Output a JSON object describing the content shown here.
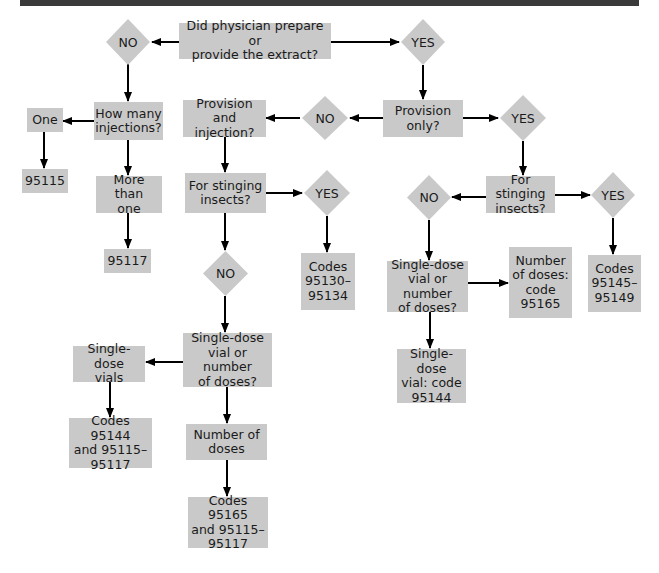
{
  "colors": {
    "node_fill": "#c9c9c9",
    "text": "#1a1a1a",
    "edge": "#000000",
    "top_bar": "#3a3a3a"
  },
  "flowchart": {
    "nodes": {
      "q_prepare": {
        "type": "process",
        "label": "Did physician prepare or\nprovide the extract?"
      },
      "d_no_top": {
        "type": "decision",
        "label": "NO"
      },
      "d_yes_top": {
        "type": "decision",
        "label": "YES"
      },
      "q_how_many": {
        "type": "process",
        "label": "How many\ninjections?"
      },
      "a_one": {
        "type": "process",
        "label": "One"
      },
      "c_95115": {
        "type": "process",
        "label": "95115"
      },
      "a_more_than_one": {
        "type": "process",
        "label": "More than\none"
      },
      "c_95117": {
        "type": "process",
        "label": "95117"
      },
      "q_provision_only": {
        "type": "process",
        "label": "Provision\nonly?"
      },
      "d_no_provision": {
        "type": "decision",
        "label": "NO"
      },
      "d_yes_provision": {
        "type": "decision",
        "label": "YES"
      },
      "q_provision_injection": {
        "type": "process",
        "label": "Provision and\ninjection?"
      },
      "q_stinging_left": {
        "type": "process",
        "label": "For stinging\ninsects?"
      },
      "d_yes_sting_left": {
        "type": "decision",
        "label": "YES"
      },
      "c_95130_95134": {
        "type": "process",
        "label": "Codes\n95130–\n95134"
      },
      "d_no_sting_left": {
        "type": "decision",
        "label": "NO"
      },
      "q_vial_left": {
        "type": "process",
        "label": "Single-dose\nvial or number\nof doses?"
      },
      "a_single_dose_vials": {
        "type": "process",
        "label": "Single-dose\nvials"
      },
      "c_95144_95115_95117": {
        "type": "process",
        "label": "Codes 95144\nand 95115–\n95117"
      },
      "a_number_of_doses": {
        "type": "process",
        "label": "Number of\ndoses"
      },
      "c_95165_95115_95117": {
        "type": "process",
        "label": "Codes 95165\nand 95115–\n95117"
      },
      "q_stinging_right": {
        "type": "process",
        "label": "For stinging\ninsects?"
      },
      "d_no_sting_right": {
        "type": "decision",
        "label": "NO"
      },
      "d_yes_sting_right": {
        "type": "decision",
        "label": "YES"
      },
      "c_95145_95149": {
        "type": "process",
        "label": "Codes\n95145–\n95149"
      },
      "q_vial_right": {
        "type": "process",
        "label": "Single-dose\nvial or number\nof doses?"
      },
      "c_number_doses_95165": {
        "type": "process",
        "label": "Number\nof doses:\ncode\n95165"
      },
      "c_single_dose_95144": {
        "type": "process",
        "label": "Single-dose\nvial: code\n95144"
      }
    },
    "edges": [
      [
        "q_prepare",
        "d_no_top"
      ],
      [
        "q_prepare",
        "d_yes_top"
      ],
      [
        "d_no_top",
        "q_how_many"
      ],
      [
        "q_how_many",
        "a_one"
      ],
      [
        "a_one",
        "c_95115"
      ],
      [
        "q_how_many",
        "a_more_than_one"
      ],
      [
        "a_more_than_one",
        "c_95117"
      ],
      [
        "d_yes_top",
        "q_provision_only"
      ],
      [
        "q_provision_only",
        "d_no_provision"
      ],
      [
        "d_no_provision",
        "q_provision_injection"
      ],
      [
        "q_provision_only",
        "d_yes_provision"
      ],
      [
        "q_provision_injection",
        "q_stinging_left"
      ],
      [
        "q_stinging_left",
        "d_yes_sting_left"
      ],
      [
        "d_yes_sting_left",
        "c_95130_95134"
      ],
      [
        "q_stinging_left",
        "d_no_sting_left"
      ],
      [
        "d_no_sting_left",
        "q_vial_left"
      ],
      [
        "q_vial_left",
        "a_single_dose_vials"
      ],
      [
        "a_single_dose_vials",
        "c_95144_95115_95117"
      ],
      [
        "q_vial_left",
        "a_number_of_doses"
      ],
      [
        "a_number_of_doses",
        "c_95165_95115_95117"
      ],
      [
        "d_yes_provision",
        "q_stinging_right"
      ],
      [
        "q_stinging_right",
        "d_no_sting_right"
      ],
      [
        "q_stinging_right",
        "d_yes_sting_right"
      ],
      [
        "d_yes_sting_right",
        "c_95145_95149"
      ],
      [
        "d_no_sting_right",
        "q_vial_right"
      ],
      [
        "q_vial_right",
        "c_number_doses_95165"
      ],
      [
        "q_vial_right",
        "c_single_dose_95144"
      ]
    ]
  }
}
